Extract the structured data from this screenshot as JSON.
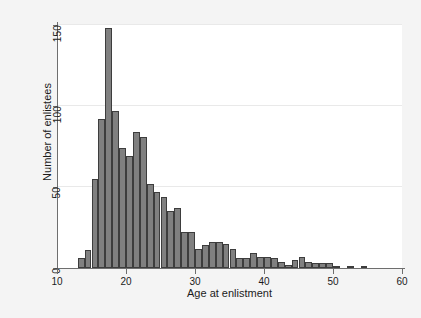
{
  "chart_data": {
    "type": "bar",
    "title": "",
    "subtitle": "",
    "xlabel": "Age at enlistment",
    "ylabel": "Number of enlistees",
    "xlim": [
      10,
      60
    ],
    "ylim": [
      0,
      150
    ],
    "xticks": [
      10,
      20,
      30,
      40,
      50,
      60
    ],
    "yticks": [
      0,
      50,
      100,
      150
    ],
    "grid": "horizontal",
    "legend": "none",
    "bin_width": 1,
    "bar_color": "#808080",
    "bar_edge_color": "#3d3d3d",
    "panel_color": "#ffffff",
    "page_color": "#f4f4f4",
    "text_color": "#1b1b1b",
    "axis_color": "#6e6e6e",
    "gridline_color": "#e9e9e9",
    "categories": [
      13.5,
      14.5,
      15.5,
      16.5,
      17.5,
      18.5,
      19.5,
      20.5,
      21.5,
      22.5,
      23.5,
      24.5,
      25.5,
      26.5,
      27.5,
      28.5,
      29.5,
      30.5,
      31.5,
      32.5,
      33.5,
      34.5,
      35.5,
      36.5,
      37.5,
      38.5,
      39.5,
      40.5,
      41.5,
      42.5,
      43.5,
      44.5,
      45.5,
      46.5,
      47.5,
      48.5,
      49.5,
      50.5,
      52.5,
      54.5
    ],
    "values": [
      6,
      11,
      55,
      92,
      148,
      97,
      74,
      69,
      84,
      81,
      52,
      47,
      44,
      35,
      37,
      22,
      22,
      12,
      14,
      16,
      16,
      15,
      12,
      6,
      6,
      9,
      7,
      7,
      6,
      4,
      2,
      5,
      7,
      4,
      3,
      3,
      3,
      1,
      1,
      1
    ]
  },
  "axes": {
    "x_tick_labels": [
      "10",
      "20",
      "30",
      "40",
      "50",
      "60"
    ],
    "y_tick_labels": [
      "0",
      "50",
      "100",
      "150"
    ],
    "x_axis_title": "Age at enlistment",
    "y_axis_title": "Number of enlistees"
  }
}
